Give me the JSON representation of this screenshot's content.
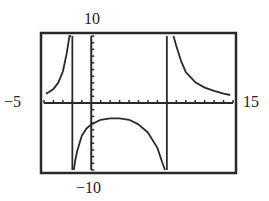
{
  "window": {
    "xmin_label": "−5",
    "xmax_label": "15",
    "ymin_label": "−10",
    "ymax_label": "10"
  },
  "chart_data": {
    "type": "line",
    "title": "",
    "xlabel": "",
    "ylabel": "",
    "xlim": [
      -5,
      15
    ],
    "ylim": [
      -10,
      10
    ],
    "xscale_tick": 1,
    "yscale_tick": 1,
    "grid": false,
    "legend": null,
    "vertical_asymptotes": [
      -2,
      8
    ],
    "horizontal_asymptote": 0,
    "colors": {
      "curve": "#2a2a2a",
      "axes": "#2a2a2a",
      "frame": "#2a2a2a",
      "background": "#ffffff"
    },
    "series": [
      {
        "name": "left branch (x < -2)",
        "x": [
          -4.8,
          -4.5,
          -4.0,
          -3.5,
          -3.0,
          -2.6,
          -2.3,
          -2.15
        ],
        "y": [
          1.4,
          1.6,
          2.1,
          3.0,
          4.7,
          7.4,
          10,
          10
        ]
      },
      {
        "name": "middle branch (-2 < x < 8)",
        "x": [
          -1.85,
          -1.7,
          -1.5,
          -1.0,
          -0.5,
          0,
          1,
          2,
          3,
          4,
          5,
          6,
          7,
          7.5,
          7.8
        ],
        "y": [
          -10,
          -8.6,
          -7.2,
          -4.9,
          -3.8,
          -3.2,
          -2.5,
          -2.3,
          -2.3,
          -2.5,
          -3.2,
          -4.4,
          -6.7,
          -8.8,
          -10
        ]
      },
      {
        "name": "right branch (x > 8)",
        "x": [
          8.7,
          9.0,
          9.5,
          10,
          11,
          12,
          13,
          14,
          14.7
        ],
        "y": [
          10,
          8.5,
          6.3,
          4.6,
          3.1,
          2.3,
          1.8,
          1.4,
          1.2
        ]
      }
    ]
  }
}
